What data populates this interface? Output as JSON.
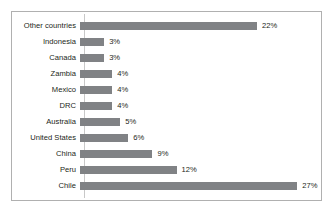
{
  "chart_data": {
    "type": "bar",
    "orientation": "horizontal",
    "title": "",
    "subtitle": "",
    "xlabel": "",
    "ylabel": "",
    "xlim": [
      0,
      28
    ],
    "grid": false,
    "legend": null,
    "value_suffix": "%",
    "categories": [
      "Other countries",
      "Indonesia",
      "Canada",
      "Zambia",
      "Mexico",
      "DRC",
      "Australia",
      "United States",
      "China",
      "Peru",
      "Chile"
    ],
    "values": [
      22,
      3,
      3,
      4,
      4,
      4,
      5,
      6,
      9,
      12,
      27
    ],
    "value_labels": [
      "22%",
      "3%",
      "3%",
      "4%",
      "4%",
      "4%",
      "5%",
      "6%",
      "9%",
      "12%",
      "27%"
    ],
    "bars": [
      {
        "category": "Other countries",
        "value": 22,
        "label": "22%"
      },
      {
        "category": "Indonesia",
        "value": 3,
        "label": "3%"
      },
      {
        "category": "Canada",
        "value": 3,
        "label": "3%"
      },
      {
        "category": "Zambia",
        "value": 4,
        "label": "4%"
      },
      {
        "category": "Mexico",
        "value": 4,
        "label": "4%"
      },
      {
        "category": "DRC",
        "value": 4,
        "label": "4%"
      },
      {
        "category": "Australia",
        "value": 5,
        "label": "5%"
      },
      {
        "category": "United States",
        "value": 6,
        "label": "6%"
      },
      {
        "category": "China",
        "value": 9,
        "label": "9%"
      },
      {
        "category": "Peru",
        "value": 12,
        "label": "12%"
      },
      {
        "category": "Chile",
        "value": 27,
        "label": "27%"
      }
    ]
  },
  "style": {
    "bar_color": "#808285",
    "text_color": "#231f20",
    "frame_border_color": "#b0b0b0",
    "axis_line_color": "#c8c8c8",
    "background": "#ffffff"
  },
  "scale": {
    "px_per_unit": 8.05,
    "max_value": 27
  }
}
